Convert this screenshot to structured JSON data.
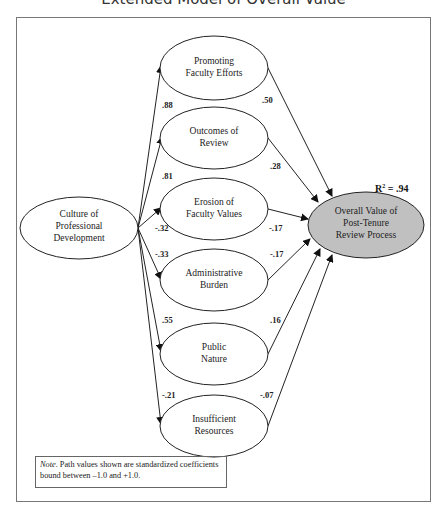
{
  "title": "Extended Model of Overall Value",
  "source_node": {
    "lines": [
      "Culture of",
      "Professional",
      "Development"
    ]
  },
  "target_node": {
    "lines": [
      "Overall Value of",
      "Post-Tenure",
      "Review Process"
    ],
    "r_squared_label": "R",
    "r_squared_sup": "2",
    "r_squared_value": " = .94",
    "fill": "#c0c0c0"
  },
  "mediators": [
    {
      "lines": [
        "Promoting",
        "Faculty Efforts"
      ],
      "path_in": ".88",
      "path_out": ".50"
    },
    {
      "lines": [
        "Outcomes of",
        "Review"
      ],
      "path_in": ".81",
      "path_out": ".28"
    },
    {
      "lines": [
        "Erosion of",
        "Faculty Values"
      ],
      "path_in": "-.32",
      "path_out": "-.17"
    },
    {
      "lines": [
        "Administrative",
        "Burden"
      ],
      "path_in": "-.33",
      "path_out": "-.17"
    },
    {
      "lines": [
        "Public",
        "Nature"
      ],
      "path_in": ".55",
      "path_out": ".16"
    },
    {
      "lines": [
        "Insufficient",
        "Resources"
      ],
      "path_in": "-.21",
      "path_out": "-.07"
    }
  ],
  "note": {
    "label": "Note.",
    "text": " Path values shown are standardized coefficients bound between –1.0 and +1.0."
  }
}
